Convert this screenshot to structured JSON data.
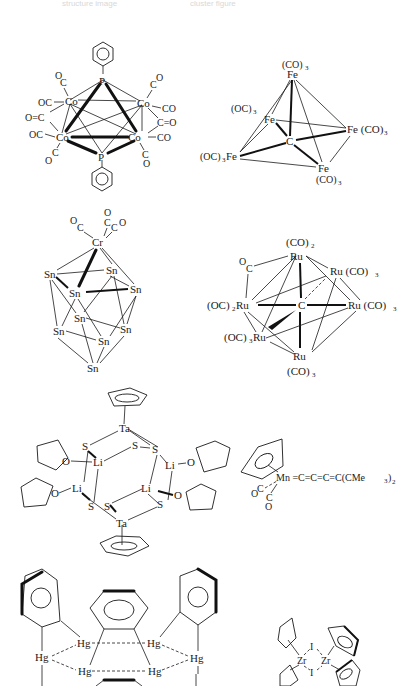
{
  "figure": {
    "header_faint": [
      "structure image",
      "cluster figure"
    ],
    "structures": [
      {
        "id": "co4p2",
        "name": "Co4(CO)10(PPh)2",
        "atoms": {
          "P_top": "P",
          "P_bottom": "P",
          "Co1": "Co",
          "Co2": "Co",
          "Co3": "Co",
          "Co4": "Co"
        },
        "ligands": {
          "oc_tl": "O",
          "c_tl": "C",
          "oc_l1": "OC",
          "oc_l2": "O=C",
          "oc_l3": "OC",
          "oc_bl_c": "C",
          "oc_bl_o": "O",
          "oc_tr_o": "O",
          "oc_tr_c": "C",
          "co_r1": "CO",
          "co_r2": "C=O",
          "co_r3": "CO",
          "oc_br_c": "C",
          "oc_br_o": "O"
        }
      },
      {
        "id": "fe5c",
        "name": "Fe5(CO)15C",
        "labels": {
          "top_co": "(CO)",
          "top_sub": "3",
          "top_fe": "Fe",
          "left_oc": "(OC)",
          "left_sub": "3",
          "mid_fe": "Fe",
          "right_fe": "Fe (CO)",
          "right_sub": "3",
          "center_c": "C",
          "bl_oc": "(OC)",
          "bl_sub": "3",
          "bl_fe": "Fe",
          "bottom_fe": "Fe",
          "bottom_co": "(CO)",
          "bottom_sub": "3"
        }
      },
      {
        "id": "crsn9",
        "name": "Sn9Cr(CO)3",
        "labels": {
          "cr": "Cr",
          "co_o1": "O",
          "co_c1": "C",
          "co_o2": "O",
          "co_c2": "C",
          "co_c3": "C",
          "co_o3": "O",
          "sn": "Sn"
        }
      },
      {
        "id": "ru6c",
        "name": "Ru6C(CO)17",
        "labels": {
          "top_co": "(CO)",
          "top_sub": "2",
          "ru": "Ru",
          "bridge_o": "O",
          "bridge_c": "C",
          "ru_co3": "Ru (CO)",
          "sub3": "3",
          "left": "(OC)",
          "left_sub": "2",
          "bl": "(OC)",
          "bl_sub": "3",
          "center_c": "C",
          "bottom_co": "(CO)"
        }
      },
      {
        "id": "tali",
        "name": "[CpTaS3Li2(THF)2]2",
        "labels": {
          "ta": "Ta",
          "s": "S",
          "li": "Li",
          "o": "O"
        }
      },
      {
        "id": "mn_cumulene",
        "name": "CpMn(CO)2=C=C=C=C(CMe3)2",
        "labels": {
          "mn_chain": "Mn =C=C=C=C(CMe",
          "sub3": "3",
          "close": ")",
          "sub2": "2",
          "oc_o": "O",
          "oc_c": "C",
          "c2": "C",
          "o2": "O"
        }
      },
      {
        "id": "hg_cluster",
        "name": "o-phenylenemercury trimer/hexamer",
        "labels": {
          "hg": "Hg"
        }
      },
      {
        "id": "zr_iodide",
        "name": "[Cp2ZrI]2",
        "labels": {
          "zr": "Zr",
          "i": "I"
        }
      }
    ]
  }
}
